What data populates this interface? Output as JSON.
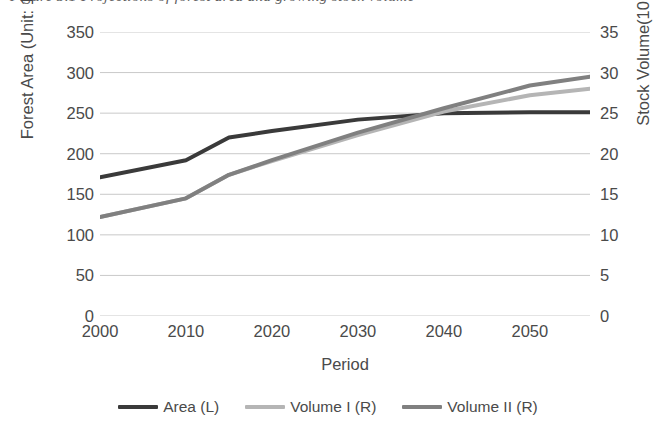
{
  "caption": {
    "text": "Figure 3.1  Projections of forest area and growing stock volume"
  },
  "chart_data": {
    "type": "line",
    "title": "",
    "xlabel": "Period",
    "ylabel": "Forest Area (Unit: 10⁶ ha)",
    "y2label": "Stock Volume(10⁹m³)",
    "xlim": [
      2000,
      2057
    ],
    "ylim": [
      0,
      350
    ],
    "y2lim": [
      0,
      35
    ],
    "grid": true,
    "legend_position": "bottom",
    "xticks": [
      "2000",
      "2010",
      "2020",
      "2030",
      "2040",
      "2050"
    ],
    "xtick_values": [
      2000,
      2010,
      2020,
      2030,
      2040,
      2050
    ],
    "yticks": [
      "0",
      "50",
      "100",
      "150",
      "200",
      "250",
      "300",
      "350"
    ],
    "ytick_values": [
      0,
      50,
      100,
      150,
      200,
      250,
      300,
      350
    ],
    "y2ticks": [
      "0",
      "5",
      "10",
      "15",
      "20",
      "25",
      "30",
      "35"
    ],
    "y2tick_values": [
      0,
      5,
      10,
      15,
      20,
      25,
      30,
      35
    ],
    "x": [
      2000,
      2010,
      2015,
      2020,
      2030,
      2040,
      2050,
      2057
    ],
    "series": [
      {
        "name": "Area (L)",
        "axis": "left",
        "color": "#3a3a3a",
        "values": [
          171,
          192,
          220,
          228,
          242,
          250,
          251,
          251
        ]
      },
      {
        "name": "Volume I (R)",
        "axis": "right",
        "color": "#b5b5b5",
        "values": [
          12.2,
          14.5,
          17.4,
          19.1,
          22.3,
          25.2,
          27.2,
          28.0
        ]
      },
      {
        "name": "Volume II (R)",
        "axis": "right",
        "color": "#808080",
        "values": [
          12.2,
          14.5,
          17.4,
          19.2,
          22.6,
          25.6,
          28.4,
          29.5
        ]
      }
    ]
  }
}
